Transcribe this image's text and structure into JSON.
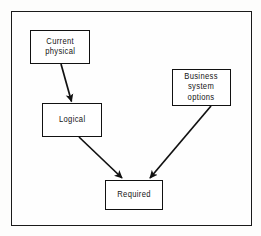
{
  "diagram": {
    "type": "flowchart",
    "title": "",
    "background_color": "#fdfdfc",
    "frame_color": "#1a1a1a",
    "node_border_color": "#111111",
    "connector_color": "#111111",
    "text_color": "#141414",
    "nodes": [
      {
        "id": "current-physical",
        "label": "Current\nphysical",
        "x": 30,
        "y": 30,
        "width": 60,
        "height": 34
      },
      {
        "id": "logical",
        "label": "Logical",
        "x": 42,
        "y": 103,
        "width": 60,
        "height": 34
      },
      {
        "id": "business-system-options",
        "label": "Business\nsystem\noptions",
        "x": 172,
        "y": 69,
        "width": 59,
        "height": 37
      },
      {
        "id": "required",
        "label": "Required",
        "x": 105,
        "y": 180,
        "width": 58,
        "height": 30
      }
    ],
    "connectors": [
      {
        "id": "current-physical-to-logical",
        "from": "current-physical",
        "to": "logical",
        "arrowhead": "filled-triangle"
      },
      {
        "id": "logical-to-required",
        "from": "logical",
        "to": "required",
        "arrowhead": "filled-triangle"
      },
      {
        "id": "business-to-required",
        "from": "business-system-options",
        "to": "required",
        "arrowhead": "filled-triangle"
      }
    ]
  }
}
